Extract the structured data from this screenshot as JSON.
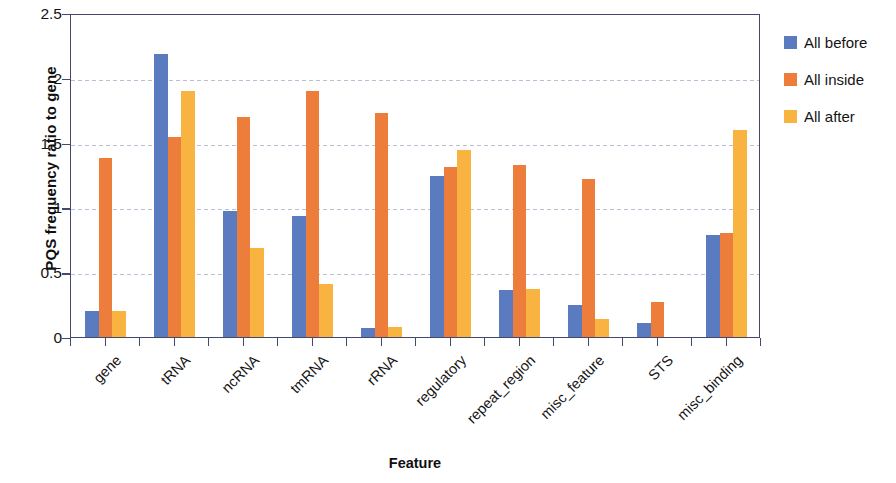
{
  "chart_data": {
    "type": "bar",
    "title": "",
    "xlabel": "Feature",
    "ylabel": "PQS frequency ratio to gene",
    "ylim": [
      0,
      2.5
    ],
    "yticks": [
      "0",
      "0.5",
      "1",
      "1.5",
      "2",
      "2.5"
    ],
    "ytick_values": [
      0,
      0.5,
      1,
      1.5,
      2,
      2.5
    ],
    "grid": true,
    "legend_position": "right",
    "categories": [
      "gene",
      "tRNA",
      "ncRNA",
      "tmRNA",
      "rRNA",
      "regulatory",
      "repeat_region",
      "misc_feature",
      "STS",
      "misc_binding"
    ],
    "series": [
      {
        "name": "All before",
        "color": "#5B7BC1",
        "values": [
          0.2,
          2.18,
          0.97,
          0.93,
          0.07,
          1.24,
          0.36,
          0.25,
          0.11,
          0.79
        ]
      },
      {
        "name": "All inside",
        "color": "#ED7D3A",
        "values": [
          1.38,
          1.54,
          1.7,
          1.9,
          1.73,
          1.31,
          1.33,
          1.22,
          0.27,
          0.8
        ]
      },
      {
        "name": "All after",
        "color": "#F9B340",
        "values": [
          0.2,
          1.9,
          0.69,
          0.41,
          0.08,
          1.44,
          0.37,
          0.14,
          0.0,
          1.6
        ]
      }
    ]
  },
  "axis_color": "#44486b",
  "gridline_color": "#b9c0d4"
}
